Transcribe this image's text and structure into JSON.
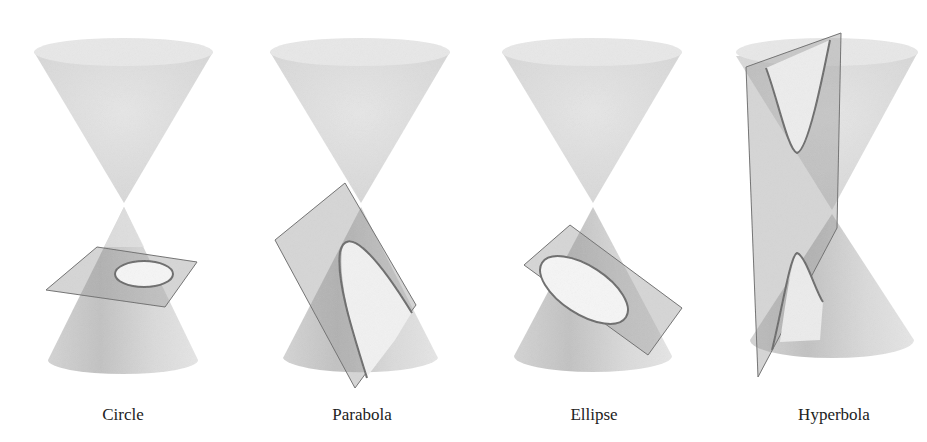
{
  "figure": {
    "panels": [
      {
        "id": "circle",
        "label": "Circle",
        "center_x": 123
      },
      {
        "id": "parabola",
        "label": "Parabola",
        "center_x": 362
      },
      {
        "id": "ellipse",
        "label": "Ellipse",
        "center_x": 594
      },
      {
        "id": "hyperbola",
        "label": "Hyperbola",
        "center_x": 834
      }
    ],
    "colors": {
      "cone_fill": "#dcdcdc",
      "cone_shadow": "#c4c4c4",
      "plane_fill": "#9a9a9a",
      "plane_stroke": "#6f6f6f",
      "curve_stroke": "#6a6a6a",
      "label_text": "#222222"
    }
  }
}
